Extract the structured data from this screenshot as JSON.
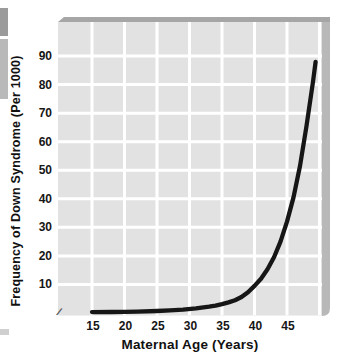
{
  "figure": {
    "axis_break_symbol": "∕∕"
  },
  "chart_data": {
    "type": "line",
    "title": "",
    "xlabel": "Maternal Age (Years)",
    "ylabel": "Frequency of Down Syndrome (Per 1000)",
    "x_ticks": [
      15,
      20,
      25,
      30,
      35,
      40,
      45
    ],
    "y_ticks": [
      10,
      20,
      30,
      40,
      50,
      60,
      70,
      80,
      90
    ],
    "x_gridlines": [
      15,
      20,
      25,
      30,
      35,
      40,
      45,
      50
    ],
    "y_gridlines": [
      10,
      20,
      30,
      40,
      50,
      60,
      70,
      80,
      90
    ],
    "xlim": [
      15,
      50
    ],
    "ylim": [
      0,
      100
    ],
    "x_axis_break": true,
    "grid": true,
    "legend": "none",
    "series": [
      {
        "name": "Frequency of Down Syndrome",
        "x": [
          15,
          18,
          20,
          22,
          25,
          27,
          29,
          31,
          33,
          34,
          35,
          36,
          37,
          38,
          39,
          40,
          41,
          42,
          43,
          44,
          45,
          46,
          47,
          48,
          49,
          49.4
        ],
        "y": [
          0.3,
          0.35,
          0.4,
          0.5,
          0.7,
          0.9,
          1.2,
          1.6,
          2.2,
          2.6,
          3.1,
          3.7,
          4.5,
          5.6,
          7.3,
          9.5,
          12,
          15.3,
          19.5,
          25,
          32,
          40.5,
          51.5,
          65.5,
          81,
          88
        ]
      }
    ],
    "colors": {
      "curve": "#161616",
      "plot_bg": "#e2e2e2",
      "gridline": "#ffffff",
      "band_top": "#a6a6a6",
      "band_right": "#b8b8b8",
      "text": "#111111"
    }
  }
}
